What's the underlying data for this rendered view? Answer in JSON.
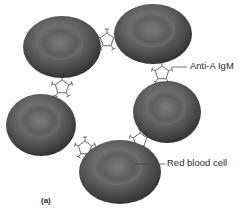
{
  "figure": {
    "panel_label": "(a)",
    "labels": {
      "antibody": "Anti-A IgM",
      "cell": "Red blood cell"
    },
    "cells": [
      {
        "cx": 62,
        "cy": 47,
        "rx": 39,
        "ry": 31
      },
      {
        "cx": 153,
        "cy": 34,
        "rx": 39,
        "ry": 30
      },
      {
        "cx": 41,
        "cy": 125,
        "rx": 35,
        "ry": 31
      },
      {
        "cx": 167,
        "cy": 112,
        "rx": 34,
        "ry": 31
      },
      {
        "cx": 120,
        "cy": 172,
        "rx": 41,
        "ry": 32
      }
    ],
    "colors": {
      "cell_dark": "#3a3a3a",
      "cell_mid": "#6e6e6e",
      "cell_light": "#9a9a9a",
      "antibody": "#6a6a6a",
      "leader": "#4a4a4a"
    }
  }
}
